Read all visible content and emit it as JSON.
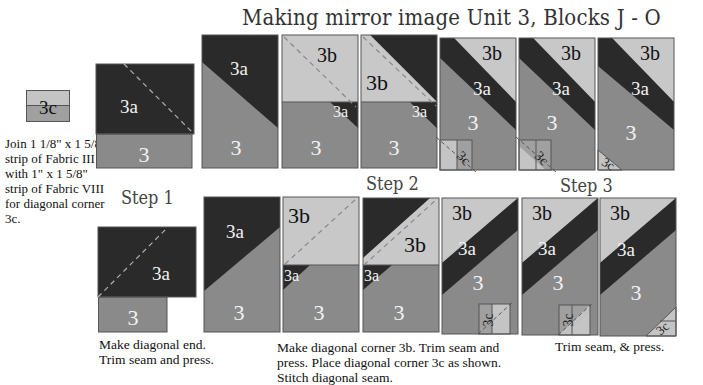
{
  "title": "Making mirror image Unit 3, Blocks J - O",
  "colors": {
    "fabric_3": "#8a8a8a",
    "fabric_3a": "#2a2a2a",
    "fabric_3b": "#c8c8c8",
    "fabric_3c_light": "#c4c4c4",
    "fabric_3c_dark": "#a0a0a0",
    "outline": "#555555",
    "seam_dash": "#aaaaaa"
  },
  "corner_unit": {
    "label": "3c",
    "note_lines": [
      "Join 1 1/8\" x 1 5/8\"",
      "strip of Fabric III",
      "with 1\" x 1 5/8\"",
      "strip of Fabric VIII",
      "for diagonal corner",
      "3c."
    ]
  },
  "steps": [
    {
      "label": "Step 1"
    },
    {
      "label": "Step 2"
    },
    {
      "label": "Step 3"
    }
  ],
  "labels": {
    "unit3": "3",
    "unit3a": "3a",
    "unit3b": "3b",
    "unit3c": "3c"
  },
  "instructions": {
    "step1": [
      "Make diagonal end.",
      "Trim seam and press."
    ],
    "step2": [
      "Make diagonal corner 3b.  Trim seam and",
      "press.  Place diagonal corner 3c as shown.",
      "Stitch diagonal seam."
    ],
    "step3": [
      "Trim seam, & press."
    ]
  },
  "rows": [
    {
      "name": "top-row",
      "orientation": "mirror-down-right",
      "panel_count": 7
    },
    {
      "name": "bottom-row",
      "orientation": "up-right",
      "panel_count": 7
    }
  ]
}
